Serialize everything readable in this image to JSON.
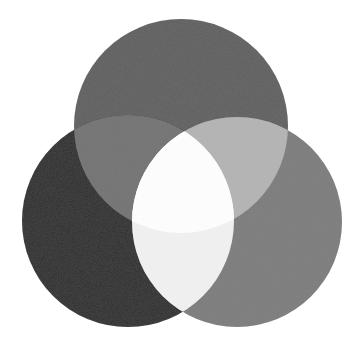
{
  "diagram": {
    "type": "three-circle-overlap",
    "background": "#ffffff",
    "circles": {
      "top": {
        "cx": 181,
        "cy": 126,
        "r": 107,
        "color": "#5e5e5e"
      },
      "left": {
        "cx": 128,
        "cy": 221,
        "r": 106,
        "color": "#2b2b2b"
      },
      "right": {
        "cx": 237,
        "cy": 222,
        "r": 105,
        "color": "#7c7c7c"
      }
    },
    "intersections": {
      "top_left": "#727272",
      "top_right": "#b4b4b4",
      "left_right": "#f2f2f2",
      "all_three": "#ffffff"
    }
  }
}
